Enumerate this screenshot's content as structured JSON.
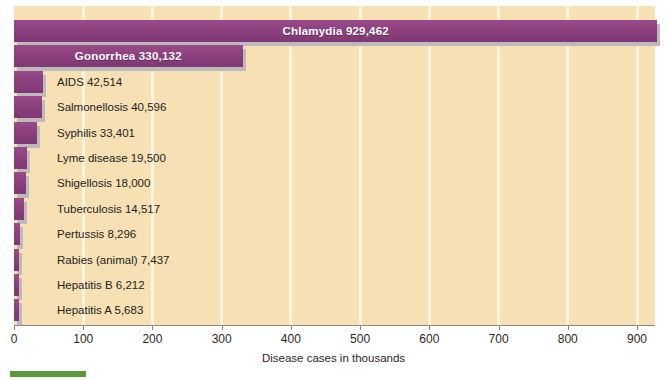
{
  "chart_data": {
    "type": "bar",
    "orientation": "horizontal",
    "title": "",
    "xlabel": "Disease cases in thousands",
    "ylabel": "",
    "xlim": [
      0,
      926
    ],
    "xticks": [
      0,
      100,
      200,
      300,
      400,
      500,
      600,
      700,
      800,
      900
    ],
    "grid": "vertical-gridlines-at-xticks",
    "legend": "none",
    "units": "thousands of cases",
    "categories": [
      "Chlamydia",
      "Gonorrhea",
      "AIDS",
      "Salmonellosis",
      "Syphilis",
      "Lyme disease",
      "Shigellosis",
      "Tuberculosis",
      "Pertussis",
      "Rabies (animal)",
      "Hepatitis B",
      "Hepatitis A"
    ],
    "values": [
      929.462,
      330.132,
      42.514,
      40.596,
      33.401,
      19.5,
      18.0,
      14.517,
      8.296,
      7.437,
      6.212,
      5.683
    ],
    "value_labels": [
      "929,462",
      "330,132",
      "42,514",
      "40,596",
      "33,401",
      "19,500",
      "18,000",
      "14,517",
      "8,296",
      "7,437",
      "6,212",
      "5,683"
    ]
  },
  "bars": [
    {
      "name": "Chlamydia",
      "value": 929.462,
      "label": "Chlamydia  929,462",
      "label_style": "inside"
    },
    {
      "name": "Gonorrhea",
      "value": 330.132,
      "label": "Gonorrhea  330,132",
      "label_style": "inside"
    },
    {
      "name": "AIDS",
      "value": 42.514,
      "label": "AIDS  42,514",
      "label_style": "outside"
    },
    {
      "name": "Salmonellosis",
      "value": 40.596,
      "label": "Salmonellosis  40,596",
      "label_style": "outside"
    },
    {
      "name": "Syphilis",
      "value": 33.401,
      "label": "Syphilis  33,401",
      "label_style": "outside"
    },
    {
      "name": "Lyme disease",
      "value": 19.5,
      "label": "Lyme disease  19,500",
      "label_style": "outside"
    },
    {
      "name": "Shigellosis",
      "value": 18.0,
      "label": "Shigellosis 18,000",
      "label_style": "outside"
    },
    {
      "name": "Tuberculosis",
      "value": 14.517,
      "label": "Tuberculosis  14,517",
      "label_style": "outside"
    },
    {
      "name": "Pertussis",
      "value": 8.296,
      "label": "Pertussis 8,296",
      "label_style": "outside"
    },
    {
      "name": "Rabies (animal)",
      "value": 7.437,
      "label": "Rabies (animal)  7,437",
      "label_style": "outside"
    },
    {
      "name": "Hepatitis B",
      "value": 6.212,
      "label": "Hepatitis B  6,212",
      "label_style": "outside"
    },
    {
      "name": "Hepatitis A",
      "value": 5.683,
      "label": "Hepatitis A  5,683",
      "label_style": "outside"
    }
  ],
  "axis": {
    "x_title": "Disease cases in thousands",
    "tick_labels": [
      "0",
      "100",
      "200",
      "300",
      "400",
      "500",
      "600",
      "700",
      "800",
      "900"
    ]
  },
  "colors": {
    "bar": "#8d4080",
    "bar_shadow": "#bdb9bd",
    "plot_background": "#f6e0b4",
    "gridline": "#fdf4de",
    "axis_line": "#8d8a85",
    "inside_label_text": "#ffffff",
    "outside_label_text": "#231f1c",
    "caption_marker": "#5a9a3c",
    "page_background": "#ffffff"
  }
}
